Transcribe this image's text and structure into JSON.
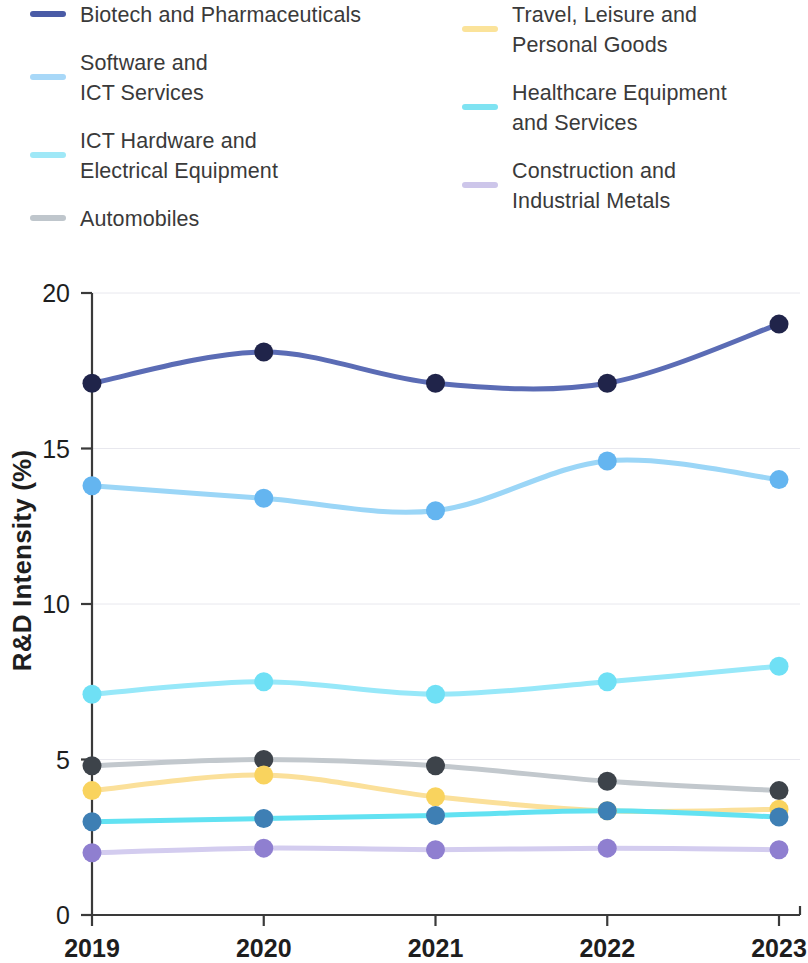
{
  "legend": {
    "left_column": [
      {
        "label": "Biotech and Pharmaceuticals",
        "color": "#4a5ba6",
        "two_line": false
      },
      {
        "label": "Software and\nICT Services",
        "color": "#a8d8f8",
        "two_line": true
      },
      {
        "label": "ICT Hardware and\nElectrical Equipment",
        "color": "#9fe8f7",
        "two_line": true
      },
      {
        "label": "Automobiles",
        "color": "#bfc6cc",
        "two_line": false
      }
    ],
    "right_column": [
      {
        "label": "Travel, Leisure and\nPersonal Goods",
        "color": "#fbe39a",
        "two_line": true
      },
      {
        "label": "Healthcare Equipment\nand Services",
        "color": "#7fe3f2",
        "two_line": true
      },
      {
        "label": "Construction and\nIndustrial Metals",
        "color": "#cdc6ea",
        "two_line": true
      }
    ]
  },
  "chart_data": {
    "type": "line",
    "title": "",
    "xlabel": "",
    "ylabel": "R&D Intensity (%)",
    "categories": [
      "2019",
      "2020",
      "2021",
      "2022",
      "2023"
    ],
    "x": [
      2019,
      2020,
      2021,
      2022,
      2023
    ],
    "ylim": [
      0,
      20
    ],
    "yticks": [
      0,
      5,
      10,
      15,
      20
    ],
    "ytick_labels": [
      "0",
      "5",
      "10",
      "15",
      "20"
    ],
    "xtick_labels": [
      "2019",
      "2020",
      "2021",
      "2022",
      "2023"
    ],
    "grid": true,
    "legend_position": "top",
    "markers": true,
    "smooth": true,
    "series": [
      {
        "name": "Biotech and Pharmaceuticals",
        "line_color": "#5b6cb5",
        "marker_color": "#20244a",
        "values": [
          17.1,
          18.1,
          17.1,
          17.1,
          19.0
        ]
      },
      {
        "name": "Software and ICT Services",
        "line_color": "#9bd6f7",
        "marker_color": "#64b5f0",
        "values": [
          13.8,
          13.4,
          13.0,
          14.6,
          14.0
        ]
      },
      {
        "name": "ICT Hardware and Electrical Equipment",
        "line_color": "#97e8f9",
        "marker_color": "#6fe0f5",
        "values": [
          7.1,
          7.5,
          7.1,
          7.5,
          8.0
        ]
      },
      {
        "name": "Automobiles",
        "line_color": "#c2c8cd",
        "marker_color": "#3d434a",
        "values": [
          4.8,
          5.0,
          4.8,
          4.3,
          4.0
        ]
      },
      {
        "name": "Travel, Leisure and Personal Goods",
        "line_color": "#fbe09a",
        "marker_color": "#f9d35e",
        "values": [
          4.0,
          4.5,
          3.8,
          3.35,
          3.4
        ]
      },
      {
        "name": "Healthcare Equipment and Services",
        "line_color": "#62e2f2",
        "marker_color": "#3e7fb4",
        "values": [
          3.0,
          3.1,
          3.2,
          3.35,
          3.15
        ]
      },
      {
        "name": "Construction and Industrial Metals",
        "line_color": "#d3ccef",
        "marker_color": "#8f7fd0",
        "values": [
          2.0,
          2.15,
          2.1,
          2.15,
          2.1
        ]
      }
    ]
  }
}
